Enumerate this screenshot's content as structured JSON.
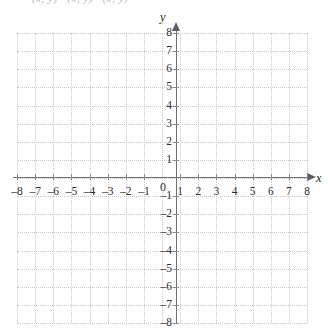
{
  "clipped_notation": {
    "text": "(x, y)   (x, y)   (x, y)"
  },
  "chart_data": {
    "type": "scatter",
    "title": "",
    "subtitle": "",
    "xlabel": "x",
    "ylabel": "y",
    "xlim": [
      -8,
      8
    ],
    "ylim": [
      -8,
      8
    ],
    "grid": true,
    "grid_step": 1,
    "grid_style": "dotted",
    "legend": "none",
    "series": [],
    "x_tick_labels": [
      "-8",
      "-7",
      "-6",
      "-5",
      "-4",
      "-3",
      "-2",
      "-1",
      "1",
      "2",
      "3",
      "4",
      "5",
      "6",
      "7",
      "8"
    ],
    "x_tick_values": [
      -8,
      -7,
      -6,
      -5,
      -4,
      -3,
      -2,
      -1,
      1,
      2,
      3,
      4,
      5,
      6,
      7,
      8
    ],
    "y_tick_labels": [
      "8",
      "7",
      "6",
      "5",
      "4",
      "3",
      "2",
      "1",
      "-1",
      "-2",
      "-3",
      "-4",
      "-5",
      "-6",
      "-7",
      "-8"
    ],
    "y_tick_values": [
      8,
      7,
      6,
      5,
      4,
      3,
      2,
      1,
      -1,
      -2,
      -3,
      -4,
      -5,
      -6,
      -7,
      -8
    ],
    "origin_label": "0",
    "annotations": [],
    "colors": {
      "grid": "#c8c8cc",
      "axis": "#6e6e73",
      "text": "#2e2e33",
      "background": "#ffffff"
    }
  }
}
